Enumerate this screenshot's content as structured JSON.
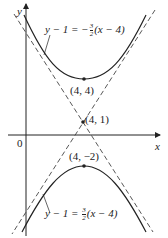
{
  "diagram": {
    "type": "hyperbola",
    "axes": {
      "x_label": "x",
      "y_label": "y",
      "origin_label": "0"
    },
    "center": {
      "label": "(4, 1)"
    },
    "vertices": [
      {
        "label": "(4, 4)"
      },
      {
        "label": "(4, −2)"
      }
    ],
    "asymptotes": [
      {
        "lhs": "y − 1 = −",
        "num": "3",
        "den": "2",
        "rhs": "(x − 4)"
      },
      {
        "lhs": "y − 1 = ",
        "num": "3",
        "den": "2",
        "rhs": "(x − 4)"
      }
    ],
    "colors": {
      "curve": "#222222",
      "asymptote": "#444444",
      "axis": "#222222"
    }
  }
}
